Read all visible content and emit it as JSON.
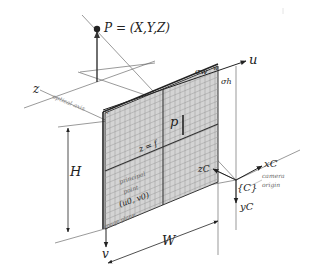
{
  "diagram": {
    "world_point": {
      "label": "P = (X,Y,Z)"
    },
    "image_point": {
      "label": "p"
    },
    "axes": {
      "z": "z",
      "optical_axis": "optical axis",
      "u": "u",
      "v": "v",
      "xc": "xC",
      "yc": "yC",
      "zc": "zC"
    },
    "dimensions": {
      "width": "W",
      "height": "H",
      "pixel_width": "σw",
      "pixel_height": "σh",
      "w_small": "w"
    },
    "image_plane": {
      "focal_label": "z = f",
      "principal_point_line1": "principal",
      "principal_point_line2": "point",
      "principal_point_coords": "(u0, v0)",
      "plane_label": "image plane",
      "corner_label": "1"
    },
    "camera": {
      "frame_label": "{C}",
      "origin_line1": "camera",
      "origin_line2": "origin"
    },
    "colors": {
      "line": "#333333",
      "grid": "#9a9a9a",
      "plane_fill": "#d4d4d4",
      "background": "#ffffff"
    }
  }
}
